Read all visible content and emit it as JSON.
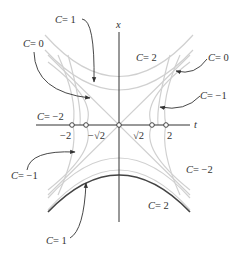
{
  "figure": {
    "axes": {
      "horizontal_label": "t",
      "vertical_label": "x",
      "ticks": [
        {
          "label": "−2",
          "value": -2
        },
        {
          "label": "−√2",
          "value": -1.414
        },
        {
          "label": "√2",
          "value": 1.414
        },
        {
          "label": "2",
          "value": 2
        }
      ]
    },
    "annotations": [
      {
        "id": "c1-top",
        "text": "= 1",
        "var": "C"
      },
      {
        "id": "c0-left",
        "text": "= 0",
        "var": "C"
      },
      {
        "id": "c2-top",
        "text": "= 2",
        "var": "C"
      },
      {
        "id": "c0-right",
        "text": "= 0",
        "var": "C"
      },
      {
        "id": "cm1-right",
        "text": "= −1",
        "var": "C"
      },
      {
        "id": "cm2-left",
        "text": "= −2",
        "var": "C"
      },
      {
        "id": "cm1-left",
        "text": "= −1",
        "var": "C"
      },
      {
        "id": "cm2-right",
        "text": "= −2",
        "var": "C"
      },
      {
        "id": "c2-bottom",
        "text": "= 2",
        "var": "C"
      },
      {
        "id": "c1-bottom",
        "text": "= 1",
        "var": "C"
      }
    ],
    "colors": {
      "axis": "#333333",
      "curve_light": "#cfcfcf",
      "curve_highlight": "#444444",
      "text": "#333333"
    }
  }
}
